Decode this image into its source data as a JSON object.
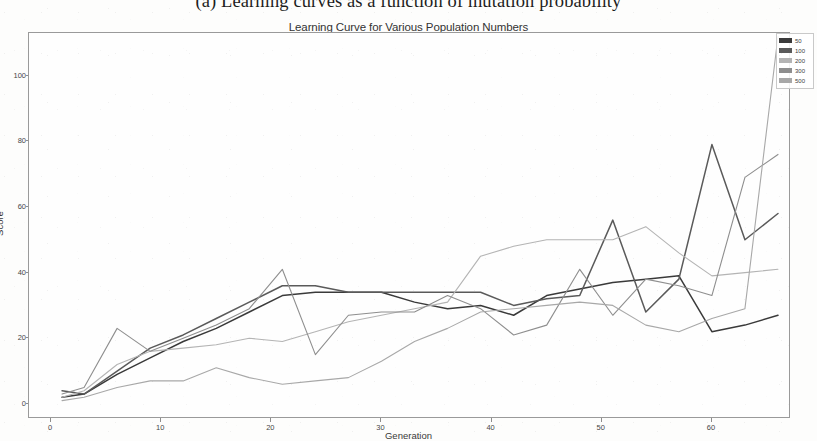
{
  "figure": {
    "caption": "(a) Learning curves as a function of mutation probability"
  },
  "chart_data": {
    "type": "line",
    "title": "Learning Curve for Various Population Numbers",
    "xlabel": "Generation",
    "ylabel": "Score",
    "xlim": [
      -2,
      67
    ],
    "ylim": [
      -4,
      113
    ],
    "xticks": [
      0,
      10,
      20,
      30,
      40,
      50,
      60
    ],
    "xtick_labels": [
      "0",
      "10",
      "20",
      "30",
      "40",
      "50",
      "60"
    ],
    "yticks": [
      0,
      20,
      40,
      60,
      80,
      100
    ],
    "ytick_labels": [
      "0",
      "20",
      "40",
      "60",
      "80",
      "100"
    ],
    "grid": false,
    "legend_position": "upper right",
    "legend_title": "",
    "x": [
      1,
      3,
      6,
      9,
      12,
      15,
      18,
      21,
      24,
      27,
      30,
      33,
      36,
      39,
      42,
      45,
      48,
      51,
      54,
      57,
      60,
      63,
      66
    ],
    "series": [
      {
        "name": "50",
        "color": "#3a3a3a",
        "values": [
          2,
          3,
          9,
          14,
          19,
          23,
          28,
          33,
          34,
          34,
          34,
          31,
          29,
          30,
          27,
          33,
          35,
          37,
          38,
          39,
          22,
          24,
          27
        ]
      },
      {
        "name": "100",
        "color": "#5a5a5a",
        "values": [
          4,
          3,
          10,
          17,
          21,
          26,
          31,
          36,
          36,
          34,
          34,
          34,
          34,
          34,
          30,
          32,
          33,
          56,
          28,
          38,
          79,
          50,
          58
        ]
      },
      {
        "name": "200",
        "color": "#b4b4b4",
        "values": [
          2,
          4,
          12,
          16,
          17,
          18,
          20,
          19,
          22,
          25,
          27,
          29,
          31,
          45,
          48,
          50,
          50,
          50,
          54,
          46,
          39,
          40,
          41
        ]
      },
      {
        "name": "300",
        "color": "#8e8e8e",
        "values": [
          3,
          5,
          23,
          16,
          20,
          24,
          29,
          41,
          15,
          27,
          28,
          28,
          33,
          29,
          21,
          24,
          41,
          27,
          38,
          36,
          33,
          69,
          76
        ]
      },
      {
        "name": "500",
        "color": "#a8a8a8",
        "values": [
          1,
          2,
          5,
          7,
          7,
          11,
          8,
          6,
          7,
          8,
          13,
          19,
          23,
          28,
          29,
          30,
          31,
          30,
          24,
          22,
          26,
          29,
          112
        ]
      }
    ]
  },
  "legend": {
    "items": [
      {
        "label": "50",
        "color": "#3a3a3a"
      },
      {
        "label": "100",
        "color": "#5a5a5a"
      },
      {
        "label": "200",
        "color": "#b4b4b4"
      },
      {
        "label": "300",
        "color": "#8e8e8e"
      },
      {
        "label": "500",
        "color": "#a8a8a8"
      }
    ]
  }
}
